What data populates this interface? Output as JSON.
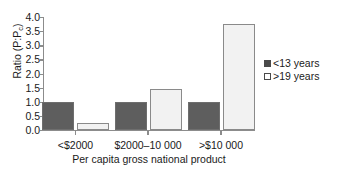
{
  "chart_data": {
    "type": "bar",
    "title": "",
    "xlabel": "Per capita gross national product",
    "ylabel": "Ratio (P:Pc)",
    "ylabel_main": "Ratio (P:P",
    "ylabel_sub": "c",
    "ylabel_tail": ")",
    "categories": [
      "<$2000",
      "$2000–10 000",
      ">$10 000"
    ],
    "series": [
      {
        "name": "<13 years",
        "values": [
          1.0,
          1.0,
          1.0
        ],
        "color": "#5e5e5e",
        "style": "filled"
      },
      {
        "name": ">19 years",
        "values": [
          0.25,
          1.45,
          3.75
        ],
        "color": "#f2f2f2",
        "style": "open"
      }
    ],
    "ylim": [
      0.0,
      4.0
    ],
    "yticks": [
      "0.0",
      "0.5",
      "1.0",
      "1.5",
      "2.0",
      "2.5",
      "3.0",
      "3.5",
      "4.0"
    ],
    "ytick_values": [
      0.0,
      0.5,
      1.0,
      1.5,
      2.0,
      2.5,
      3.0,
      3.5,
      4.0
    ],
    "grid": false,
    "legend_position": "right"
  },
  "legend": {
    "entries": [
      {
        "label": "<13 years",
        "swatch": "filled-dark-square"
      },
      {
        "label": ">19 years",
        "swatch": "open-white-square"
      }
    ]
  }
}
